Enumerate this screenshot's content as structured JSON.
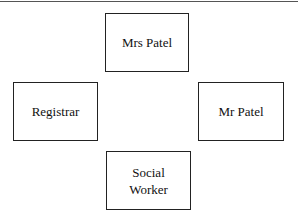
{
  "diagram": {
    "nodes": [
      {
        "id": "mrs-patel",
        "label": "Mrs Patel"
      },
      {
        "id": "registrar",
        "label": "Registrar"
      },
      {
        "id": "mr-patel",
        "label": "Mr Patel"
      },
      {
        "id": "social-worker",
        "line1": "Social",
        "line2": "Worker"
      }
    ]
  }
}
